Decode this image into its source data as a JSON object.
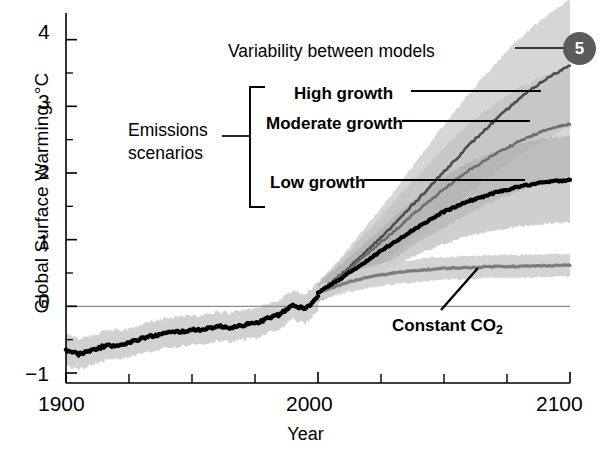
{
  "figure": {
    "badge_number": "5",
    "y_axis_title": "Global Surface Warming, °C",
    "x_axis_title": "Year"
  },
  "annotations": {
    "variability": "Variability between models",
    "emissions_line1": "Emissions",
    "emissions_line2": "scenarios",
    "high_growth": "High growth",
    "moderate_growth": "Moderate growth",
    "low_growth": "Low growth",
    "constant_co2_pre": "Constant CO",
    "constant_co2_sub": "2"
  },
  "colors": {
    "badge_fill": "#5b5b5b",
    "historical_line": "#000000",
    "high_growth_line": "#4d4d4d",
    "moderate_growth_line": "#6e6e6e",
    "low_growth_line": "#000000",
    "constant_co2_line": "#7d7d7d",
    "band_light": "#cfcfcf",
    "band_mid": "#bdbdbd",
    "band_dark": "#a8a8a8",
    "zero_line": "#8c8c8c",
    "axis": "#000000"
  },
  "chart_data": {
    "type": "line",
    "title": "",
    "xlabel": "Year",
    "ylabel": "Global Surface Warming, °C",
    "xlim": [
      1900,
      2100
    ],
    "ylim": [
      -1.15,
      4.4
    ],
    "grid": false,
    "legend_position": "inline-annotations",
    "x_ticks_major": [
      1900,
      2000,
      2100
    ],
    "x_ticks_minor": [
      1925,
      1950,
      1975,
      2025,
      2050,
      2075
    ],
    "y_ticks_major": [
      -1,
      0,
      1,
      2,
      3,
      4
    ],
    "y_ticks_minor": [
      -0.5,
      0.5,
      1.5,
      2.5,
      3.5
    ],
    "zero_reference_line": 0,
    "series": [
      {
        "name": "Historical (observed/modelled)",
        "style": "thick-black",
        "x": [
          1900,
          1905,
          1910,
          1915,
          1920,
          1925,
          1930,
          1935,
          1940,
          1945,
          1950,
          1955,
          1960,
          1965,
          1970,
          1975,
          1980,
          1985,
          1990,
          1995,
          2000
        ],
        "values": [
          -0.65,
          -0.72,
          -0.66,
          -0.6,
          -0.58,
          -0.55,
          -0.48,
          -0.44,
          -0.4,
          -0.38,
          -0.36,
          -0.34,
          -0.3,
          -0.32,
          -0.28,
          -0.26,
          -0.18,
          -0.12,
          0.02,
          -0.04,
          0.14
        ],
        "band_low": [
          -0.88,
          -0.95,
          -0.88,
          -0.82,
          -0.8,
          -0.76,
          -0.7,
          -0.66,
          -0.62,
          -0.6,
          -0.58,
          -0.56,
          -0.52,
          -0.54,
          -0.5,
          -0.48,
          -0.4,
          -0.34,
          -0.2,
          -0.26,
          -0.08
        ],
        "band_high": [
          -0.42,
          -0.49,
          -0.44,
          -0.38,
          -0.36,
          -0.34,
          -0.26,
          -0.22,
          -0.18,
          -0.16,
          -0.14,
          -0.12,
          -0.08,
          -0.1,
          -0.06,
          -0.04,
          0.04,
          0.1,
          0.24,
          0.18,
          0.36
        ]
      },
      {
        "name": "High growth",
        "style": "dark-gray",
        "x": [
          2000,
          2010,
          2020,
          2030,
          2040,
          2050,
          2060,
          2070,
          2080,
          2090,
          2100
        ],
        "values": [
          0.2,
          0.5,
          0.85,
          1.22,
          1.62,
          2.02,
          2.42,
          2.78,
          3.12,
          3.4,
          3.62
        ],
        "band_low": [
          0.05,
          0.26,
          0.5,
          0.78,
          1.08,
          1.38,
          1.7,
          2.0,
          2.28,
          2.52,
          2.7
        ],
        "band_high": [
          0.36,
          0.78,
          1.24,
          1.72,
          2.22,
          2.72,
          3.2,
          3.62,
          4.02,
          4.34,
          4.6
        ]
      },
      {
        "name": "Moderate growth",
        "style": "mid-gray",
        "x": [
          2000,
          2010,
          2020,
          2030,
          2040,
          2050,
          2060,
          2070,
          2080,
          2090,
          2100
        ],
        "values": [
          0.2,
          0.48,
          0.8,
          1.12,
          1.45,
          1.76,
          2.04,
          2.28,
          2.48,
          2.64,
          2.74
        ],
        "band_low": [
          0.06,
          0.26,
          0.48,
          0.72,
          0.96,
          1.18,
          1.4,
          1.58,
          1.74,
          1.86,
          1.94
        ],
        "band_high": [
          0.34,
          0.72,
          1.14,
          1.56,
          1.98,
          2.38,
          2.74,
          3.04,
          3.28,
          3.46,
          3.58
        ]
      },
      {
        "name": "Low growth",
        "style": "thick-black",
        "x": [
          2000,
          2010,
          2020,
          2030,
          2040,
          2050,
          2060,
          2070,
          2080,
          2090,
          2100
        ],
        "values": [
          0.2,
          0.44,
          0.7,
          0.96,
          1.2,
          1.42,
          1.58,
          1.7,
          1.8,
          1.86,
          1.9
        ],
        "band_low": [
          0.06,
          0.24,
          0.42,
          0.6,
          0.78,
          0.94,
          1.06,
          1.14,
          1.2,
          1.24,
          1.26
        ],
        "band_high": [
          0.34,
          0.66,
          1.0,
          1.34,
          1.66,
          1.94,
          2.16,
          2.32,
          2.44,
          2.52,
          2.56
        ]
      },
      {
        "name": "Constant CO2",
        "style": "gray",
        "x": [
          2000,
          2010,
          2020,
          2030,
          2040,
          2050,
          2060,
          2070,
          2080,
          2090,
          2100
        ],
        "values": [
          0.2,
          0.34,
          0.44,
          0.5,
          0.54,
          0.57,
          0.58,
          0.6,
          0.6,
          0.61,
          0.62
        ],
        "band_low": [
          0.1,
          0.2,
          0.28,
          0.33,
          0.37,
          0.4,
          0.41,
          0.43,
          0.43,
          0.44,
          0.45
        ],
        "band_high": [
          0.3,
          0.48,
          0.6,
          0.67,
          0.71,
          0.74,
          0.75,
          0.77,
          0.77,
          0.78,
          0.79
        ]
      }
    ]
  }
}
